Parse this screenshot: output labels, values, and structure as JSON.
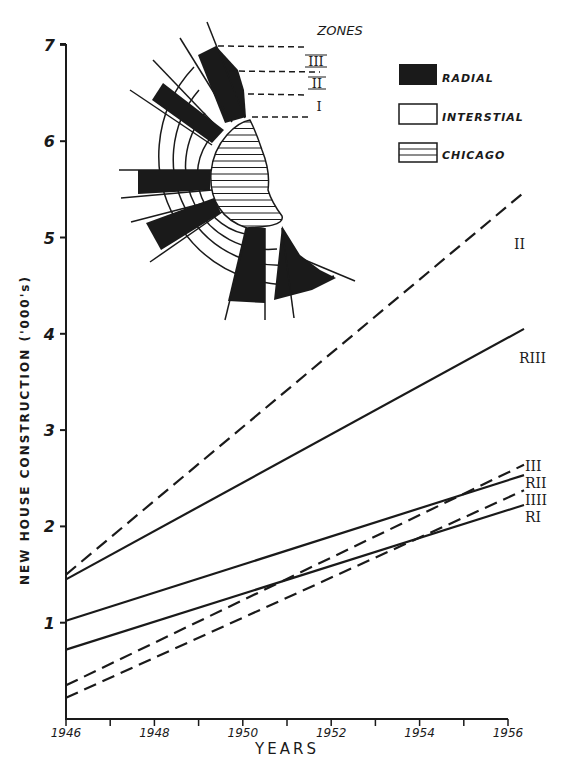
{
  "chart_data": {
    "type": "line",
    "title": "",
    "xlabel": "YEARS",
    "ylabel": "NEW HOUSE CONSTRUCTION ('000's)",
    "xlim": [
      1946,
      1956
    ],
    "ylim": [
      0,
      7
    ],
    "x_ticks": [
      "1946",
      "1948",
      "1950",
      "1952",
      "1954",
      "1956"
    ],
    "y_ticks": [
      "1",
      "2",
      "3",
      "4",
      "5",
      "6",
      "7"
    ],
    "grid": false,
    "x": [
      1946,
      1956
    ],
    "series": [
      {
        "name": "I I",
        "label": "I I",
        "style": "dashed",
        "values": [
          1.5,
          5.33
        ]
      },
      {
        "name": "R III",
        "label": "R III",
        "style": "solid",
        "values": [
          1.45,
          3.96
        ]
      },
      {
        "name": "I II",
        "label": "I II",
        "style": "dashed",
        "values": [
          0.35,
          2.56
        ]
      },
      {
        "name": "R II",
        "label": "R II",
        "style": "solid",
        "values": [
          1.02,
          2.48
        ]
      },
      {
        "name": "I III",
        "label": "I III",
        "style": "dashed",
        "values": [
          0.22,
          2.3
        ]
      },
      {
        "name": "R I",
        "label": "R I",
        "style": "solid",
        "values": [
          0.72,
          2.17
        ]
      }
    ],
    "legend": {
      "position": "upper right",
      "entries": [
        {
          "label": "RADIAL",
          "swatch": "solid-black"
        },
        {
          "label": "INTERSTIAL",
          "swatch": "white"
        },
        {
          "label": "CHICAGO",
          "swatch": "horizontal-hatch"
        }
      ]
    },
    "inset": {
      "title": "ZONES",
      "zone_labels": [
        "III",
        "II",
        "I"
      ],
      "description": "Semicircular zone diagram of Chicago with radial (black) and interstitial (white) sectors in three concentric zones"
    }
  },
  "colors": {
    "ink": "#1a1a1a",
    "background": "#ffffff"
  }
}
